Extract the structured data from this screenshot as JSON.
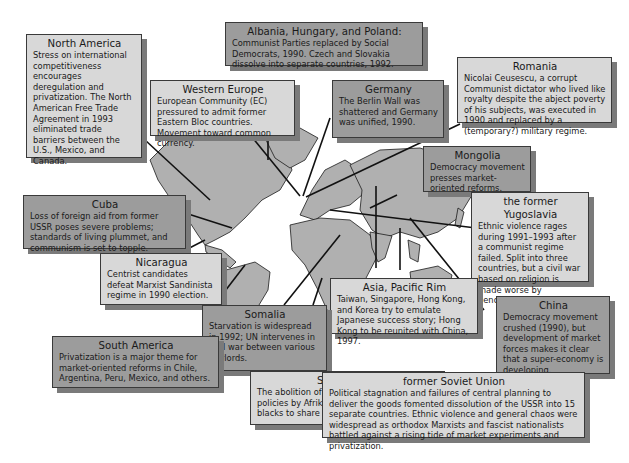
{
  "figure": {
    "type": "world-map-annotations",
    "colors": {
      "light_box": "#d8d8d8",
      "dark_box": "#9c9c9c",
      "land": "#b0b0b0",
      "shadow": "#7a7a7a",
      "line": "#111111"
    }
  },
  "callouts": {
    "north_america": {
      "title": "North America",
      "body": "Stress on international competitiveness encourages deregulation and privatization. The North American Free Trade Agreement in 1993 eliminated trade barriers between the U.S., Mexico, and Canada."
    },
    "albania_hungary_poland": {
      "title": "Albania, Hungary, and Poland:",
      "body": "Communist Parties replaced by Social Democrats, 1990. Czech and Slovakia dissolve into separate countries, 1992."
    },
    "western_europe": {
      "title": "Western Europe",
      "body": "European Community (EC) pressured to admit former Eastern Bloc countries. Movement toward common currency."
    },
    "germany": {
      "title": "Germany",
      "body": "The Berlin Wall was shattered and Germany was unified, 1990."
    },
    "romania": {
      "title": "Romania",
      "body": "Nicolai Ceusescu, a corrupt Communist dictator who lived like royalty despite the abject poverty of his subjects, was executed in 1990 and replaced by a (temporary?) military regime."
    },
    "mongolia": {
      "title": "Mongolia",
      "body": "Democracy movement presses market-oriented reforms."
    },
    "cuba": {
      "title": "Cuba",
      "body": "Loss of foreign aid from former USSR poses severe problems; standards of living plummet, and communism is set to topple."
    },
    "yugoslavia": {
      "title": "the former Yugoslavia",
      "body": "Ethnic violence rages during 1991–1993 after a communist regime failed. Split into three countries, but a civil war based on religion is made worse by genocidal policies."
    },
    "nicaragua": {
      "title": "Nicaragua",
      "body": "Centrist candidates defeat Marxist Sandinista regime in 1990 election."
    },
    "asia_pacific_rim": {
      "title": "Asia, Pacific Rim",
      "body": "Taiwan, Singapore, Hong Kong, and Korea try to emulate Japanese success story; Hong Kong to be reunited with China, 1997."
    },
    "somalia": {
      "title": "Somalia",
      "body": "Starvation is widespread in 1992; UN intervenes in civil war between various warlords."
    },
    "china": {
      "title": "China",
      "body": "Democracy movement crushed (1990), but development of market forces makes it clear that a super-economy is developing."
    },
    "south_america": {
      "title": "South America",
      "body": "Privatization is a major theme for market-oriented reforms in Chile, Argentina, Peru, Mexico, and others."
    },
    "south_africa": {
      "title": "South Africa",
      "body": "The abolition of apartheid (segregationist) policies by Afrikaaner government allows blacks to share policymaking power."
    },
    "soviet_union": {
      "title": "former Soviet Union",
      "body": "Political stagnation and failures of central planning to deliver the goods fomented dissolution of the USSR into 15 separate countries. Ethnic violence and general chaos were widespread as orthodox Marxists and fascist nationalists battled against a rising tide of market experiments and privatization."
    }
  }
}
